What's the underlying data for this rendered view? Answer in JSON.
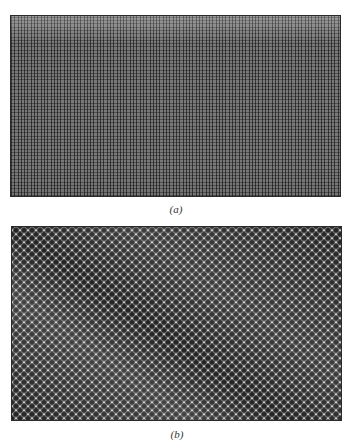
{
  "figure": {
    "panels": [
      {
        "id": "a",
        "label": "(a)",
        "description": "Fine square grid pattern, uniform gray"
      },
      {
        "id": "b",
        "label": "(b)",
        "description": "Diagonal close-packed array of rounded bumps with dark crescent shadows"
      }
    ],
    "colors": {
      "background": "#ffffff",
      "panel_border": "#2a2a2a",
      "panel_a_base": "#9a9a9a",
      "panel_b_base": "#b8b8b8"
    }
  }
}
